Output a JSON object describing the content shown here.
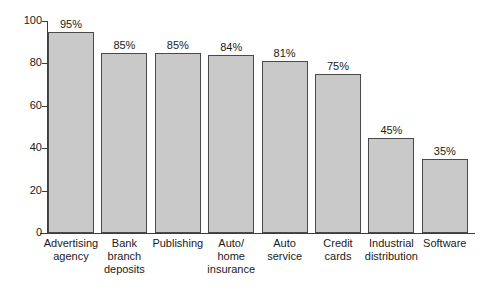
{
  "chart_data": {
    "type": "bar",
    "title": "",
    "xlabel": "",
    "ylabel": "",
    "ylim": [
      0,
      100
    ],
    "yticks": [
      0,
      20,
      40,
      60,
      80,
      100
    ],
    "ytick_labels": [
      "0",
      "20",
      "40",
      "60",
      "80",
      "100"
    ],
    "grid": false,
    "legend": false,
    "value_suffix": "%",
    "bar_fill_color": "#c9c9c9",
    "bar_border_color": "#4a4a4a",
    "axis_color": "#3d3d3d",
    "background_color": "#ffffff",
    "categories": [
      "Advertising agency",
      "Bank branch deposits",
      "Publishing",
      "Auto/ home insurance",
      "Auto service",
      "Credit cards",
      "Industrial distribution",
      "Software"
    ],
    "category_lines": [
      [
        "Advertising",
        "agency"
      ],
      [
        "Bank",
        "branch",
        "deposits"
      ],
      [
        "Publishing"
      ],
      [
        "Auto/",
        "home",
        "insurance"
      ],
      [
        "Auto",
        "service"
      ],
      [
        "Credit",
        "cards"
      ],
      [
        "Industrial",
        "distribution"
      ],
      [
        "Software"
      ]
    ],
    "values": [
      95,
      85,
      85,
      84,
      81,
      75,
      45,
      35
    ],
    "value_labels": [
      "95%",
      "85%",
      "85%",
      "84%",
      "81%",
      "75%",
      "45%",
      "35%"
    ]
  }
}
